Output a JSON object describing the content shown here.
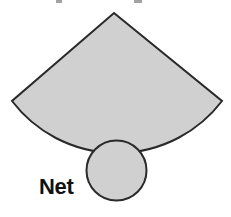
{
  "diagram": {
    "type": "cone-net",
    "label": "Net",
    "shapes": {
      "sector": {
        "apex": [
          114,
          13
        ],
        "left_corner": [
          12,
          101
        ],
        "right_corner": [
          222,
          101
        ],
        "arc_radius": 132
      },
      "base_circle": {
        "center": [
          116.5,
          170.5
        ],
        "radius": 30
      }
    },
    "colors": {
      "fill": "#d0d0d0",
      "stroke": "#2a2a2a",
      "label": "#111111",
      "background": "#ffffff"
    }
  }
}
